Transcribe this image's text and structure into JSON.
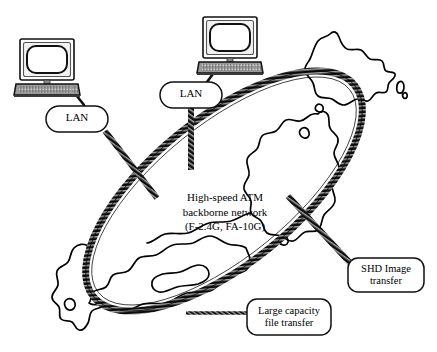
{
  "figure": {
    "kind": "network-topology-diagram",
    "background_color": "#ffffff",
    "ink_color": "#000000",
    "description_title": "High-speed ATM backbone network over map of Japan"
  },
  "backbone": {
    "center_label_lines": [
      "High-speed ATM",
      "backborne network",
      "(F-2.4G, FA-10G)"
    ],
    "line1": "High-speed ATM",
    "line2": "backborne network",
    "line3": "(F-2.4G, FA-10G)",
    "ring_shape": "ellipse",
    "ring_style": "hatched-thick-stroke",
    "ring_color": "#1a1a1a"
  },
  "nodes": [
    {
      "id": "lan-left",
      "label": "LAN",
      "shape": "rounded-rectangle",
      "x": 46,
      "y": 106,
      "width": 62,
      "height": 26
    },
    {
      "id": "lan-top",
      "label": "LAN",
      "shape": "rounded-rectangle",
      "x": 160,
      "y": 82,
      "width": 62,
      "height": 26
    },
    {
      "id": "shd-image-transfer",
      "label_lines": [
        "SHD Image",
        "transfer"
      ],
      "line1": "SHD Image",
      "line2": "transfer",
      "shape": "rounded-rectangle",
      "x": 348,
      "y": 258,
      "width": 76,
      "height": 34
    },
    {
      "id": "large-capacity-file-transfer",
      "label_lines": [
        "Large capacity",
        "file transfer"
      ],
      "line1": "Large capacity",
      "line2": "file transfer",
      "shape": "rounded-rectangle",
      "x": 247,
      "y": 299,
      "width": 84,
      "height": 36
    }
  ],
  "computers": [
    {
      "id": "computer-left",
      "type": "desktop-computer",
      "x": 16,
      "y": 38,
      "width": 64,
      "height": 52
    },
    {
      "id": "computer-top",
      "type": "desktop-computer",
      "x": 199,
      "y": 16,
      "width": 64,
      "height": 52
    }
  ],
  "links": [
    {
      "id": "link-computer-left-to-lan-left",
      "from": "computer-left",
      "to": "lan-left",
      "style": "thin-solid"
    },
    {
      "id": "link-computer-top-to-lan-top",
      "from": "computer-top",
      "to": "lan-top",
      "style": "thin-solid"
    },
    {
      "id": "link-lan-left-to-backbone",
      "from": "lan-left",
      "to": "backbone",
      "style": "hatched-thick"
    },
    {
      "id": "link-lan-top-to-backbone",
      "from": "lan-top",
      "to": "backbone",
      "style": "hatched-thick"
    },
    {
      "id": "link-backbone-to-shd",
      "from": "backbone",
      "to": "shd-image-transfer",
      "style": "hatched-thick"
    },
    {
      "id": "link-backbone-to-file-transfer",
      "from": "backbone",
      "to": "large-capacity-file-transfer",
      "style": "hatched-thin"
    }
  ],
  "map": {
    "region": "Japan",
    "islands": [
      "Hokkaido",
      "Honshu",
      "Shikoku",
      "Kyushu"
    ],
    "stroke_color": "#000000",
    "fill": "none"
  }
}
